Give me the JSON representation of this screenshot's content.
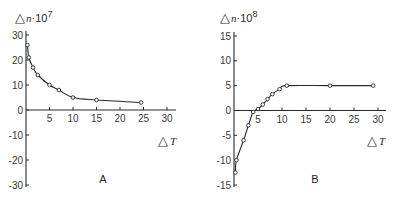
{
  "chart_data": [
    {
      "type": "line",
      "panel_label": "A",
      "title": "",
      "ylabel": "Δn·10⁷",
      "ylabel_parts": {
        "delta": "△",
        "var": "n",
        "mult": "·10",
        "exp": "7"
      },
      "xlabel": "ΔT",
      "xlabel_parts": {
        "delta": "△",
        "var": "T"
      },
      "xlim": [
        0,
        30
      ],
      "ylim": [
        -30,
        30
      ],
      "xticks": [
        5,
        10,
        15,
        20,
        25,
        30
      ],
      "yticks": [
        30,
        20,
        10,
        0,
        -10,
        -20,
        -30
      ],
      "xtick_labels": [
        "5",
        "10",
        "15",
        "20",
        "25",
        "30"
      ],
      "ytick_labels": [
        "30",
        "20",
        "10",
        "0",
        "-10",
        "-20",
        "-30"
      ],
      "grid": false,
      "markers": "open-circle",
      "series": [
        {
          "name": "A",
          "x": [
            0.3,
            0.6,
            1.5,
            2.5,
            5,
            7,
            10,
            15,
            24.5
          ],
          "y": [
            26,
            21,
            17,
            14,
            10,
            8,
            5,
            4,
            3
          ]
        }
      ]
    },
    {
      "type": "line",
      "panel_label": "B",
      "title": "",
      "ylabel": "Δn·10⁸",
      "ylabel_parts": {
        "delta": "△",
        "var": "n",
        "mult": "·10",
        "exp": "8"
      },
      "xlabel": "ΔT",
      "xlabel_parts": {
        "delta": "△",
        "var": "T"
      },
      "xlim": [
        0,
        30
      ],
      "ylim": [
        -15,
        15
      ],
      "xticks": [
        5,
        10,
        15,
        20,
        25,
        30
      ],
      "yticks": [
        15,
        10,
        5,
        0,
        -5,
        -10,
        -15
      ],
      "xtick_labels": [
        "5",
        "10",
        "15",
        "20",
        "25",
        "30"
      ],
      "ytick_labels": [
        "15",
        "10",
        "5",
        "0",
        "-5",
        "-10",
        "-15"
      ],
      "grid": false,
      "markers": "open-circle",
      "series": [
        {
          "name": "B",
          "x": [
            0.3,
            0.5,
            2,
            3,
            4,
            5,
            6,
            7,
            8,
            9.5,
            11,
            20,
            29
          ],
          "y": [
            -12.5,
            -10,
            -6,
            -3,
            -0.3,
            0.3,
            1.2,
            2.3,
            3.3,
            4.3,
            5,
            5,
            5
          ]
        }
      ]
    }
  ],
  "colors": {
    "ink": "#2a2a2a",
    "background": "#ffffff"
  }
}
